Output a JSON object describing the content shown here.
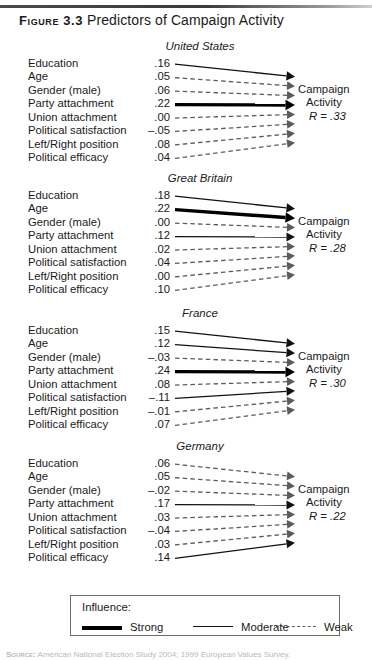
{
  "figure": {
    "number_label": "Figure 3.3",
    "caption": "Predictors of Campaign Activity"
  },
  "outcome_label": {
    "line1": "Campaign",
    "line2": "Activity"
  },
  "legend": {
    "title": "Influence:",
    "items": [
      {
        "label": "Strong",
        "style": "strong"
      },
      {
        "label": "Moderate",
        "style": "moderate"
      },
      {
        "label": "Weak",
        "style": "weak"
      }
    ]
  },
  "source": {
    "label": "Source:",
    "text": "American National Election Study 2004; 1999 European Values Survey."
  },
  "colors": {
    "strong": "#000000",
    "moderate": "#111111",
    "weak": "#5b5b5b",
    "rule": "#3a3a3a",
    "legend_border": "#6d6d6d",
    "text": "#1a1a1a",
    "background": "#ffffff"
  },
  "chart_data": {
    "type": "diagram",
    "title": "Predictors of Campaign Activity",
    "diagram_kind": "path-coefficient arrow diagram",
    "outcome": "Campaign Activity",
    "predictors": [
      "Education",
      "Age",
      "Gender (male)",
      "Party attachment",
      "Union attachment",
      "Political satisfaction",
      "Left/Right position",
      "Political efficacy"
    ],
    "influence_scale": {
      "strong": "thick solid arrow",
      "moderate": "thin solid arrow",
      "weak": "dashed arrow"
    },
    "panels": [
      {
        "name": "United States",
        "multiple_r_label": "R = .33",
        "multiple_r": 0.33,
        "values": [
          ".16",
          ".05",
          ".06",
          ".22",
          ".00",
          "–.05",
          ".08",
          ".04"
        ],
        "numeric_values": [
          0.16,
          0.05,
          0.06,
          0.22,
          0.0,
          -0.05,
          0.08,
          0.04
        ],
        "styles": [
          "moderate",
          "weak",
          "weak",
          "strong",
          "weak",
          "weak",
          "weak",
          "weak"
        ]
      },
      {
        "name": "Great Britain",
        "multiple_r_label": "R = .28",
        "multiple_r": 0.28,
        "values": [
          ".18",
          ".22",
          ".00",
          ".12",
          ".02",
          ".04",
          ".00",
          ".10"
        ],
        "numeric_values": [
          0.18,
          0.22,
          0.0,
          0.12,
          0.02,
          0.04,
          0.0,
          0.1
        ],
        "styles": [
          "moderate",
          "strong",
          "weak",
          "moderate",
          "weak",
          "weak",
          "weak",
          "weak"
        ]
      },
      {
        "name": "France",
        "multiple_r_label": "R = .30",
        "multiple_r": 0.3,
        "values": [
          ".15",
          ".12",
          "–.03",
          ".24",
          ".08",
          "–.11",
          "–.01",
          ".07"
        ],
        "numeric_values": [
          0.15,
          0.12,
          -0.03,
          0.24,
          0.08,
          -0.11,
          -0.01,
          0.07
        ],
        "styles": [
          "moderate",
          "moderate",
          "weak",
          "strong",
          "weak",
          "moderate",
          "weak",
          "weak"
        ]
      },
      {
        "name": "Germany",
        "multiple_r_label": "R = .22",
        "multiple_r": 0.22,
        "values": [
          ".06",
          ".05",
          "–.02",
          ".17",
          ".03",
          "–.04",
          ".03",
          ".14"
        ],
        "numeric_values": [
          0.06,
          0.05,
          -0.02,
          0.17,
          0.03,
          -0.04,
          0.03,
          0.14
        ],
        "styles": [
          "weak",
          "weak",
          "weak",
          "moderate",
          "weak",
          "weak",
          "weak",
          "moderate"
        ]
      }
    ]
  }
}
